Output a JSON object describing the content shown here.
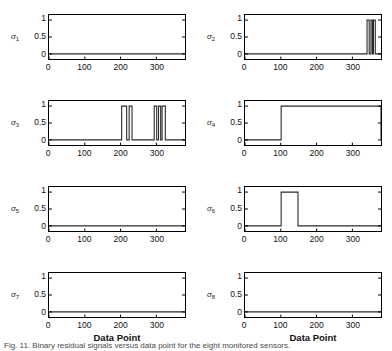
{
  "figure": {
    "xlabel": "Data Point",
    "caption_prefix": "Fig.",
    "caption": "Fig. 11.  Binary residual signals versus data point for the eight monitored sensors."
  },
  "chart_data": [
    {
      "type": "line",
      "title": "",
      "ylabel": "σ₁",
      "ylabel_base": "σ",
      "ylabel_sub": "1",
      "xlabel": "Data Point",
      "xlim": [
        0,
        380
      ],
      "ylim": [
        -0.15,
        1.15
      ],
      "xticks": [
        0,
        100,
        200,
        300
      ],
      "yticks": [
        0,
        0.5,
        1
      ],
      "grid": false,
      "x": [
        0,
        380
      ],
      "values": [
        0,
        0
      ],
      "steps": []
    },
    {
      "type": "line",
      "title": "",
      "ylabel": "σ₂",
      "ylabel_base": "σ",
      "ylabel_sub": "2",
      "xlabel": "Data Point",
      "xlim": [
        0,
        380
      ],
      "ylim": [
        -0.15,
        1.15
      ],
      "xticks": [
        0,
        100,
        200,
        300
      ],
      "yticks": [
        0,
        0.5,
        1
      ],
      "grid": false,
      "steps": [
        [
          341,
          347
        ],
        [
          352,
          356
        ],
        [
          359,
          364
        ]
      ]
    },
    {
      "type": "line",
      "title": "",
      "ylabel": "σ₃",
      "ylabel_base": "σ",
      "ylabel_sub": "3",
      "xlabel": "Data Point",
      "xlim": [
        0,
        380
      ],
      "ylim": [
        -0.15,
        1.15
      ],
      "xticks": [
        0,
        100,
        200,
        300
      ],
      "yticks": [
        0,
        0.5,
        1
      ],
      "grid": false,
      "steps": [
        [
          203,
          217
        ],
        [
          224,
          232
        ],
        [
          294,
          301
        ],
        [
          306,
          312
        ],
        [
          316,
          325
        ]
      ]
    },
    {
      "type": "line",
      "title": "",
      "ylabel": "σ₄",
      "ylabel_base": "σ",
      "ylabel_sub": "4",
      "xlabel": "Data Point",
      "xlim": [
        0,
        380
      ],
      "ylim": [
        -0.15,
        1.15
      ],
      "xticks": [
        0,
        100,
        200,
        300
      ],
      "yticks": [
        0,
        0.5,
        1
      ],
      "grid": false,
      "steps": [
        [
          101,
          380
        ]
      ]
    },
    {
      "type": "line",
      "title": "",
      "ylabel": "σ₅",
      "ylabel_base": "σ",
      "ylabel_sub": "5",
      "xlabel": "Data Point",
      "xlim": [
        0,
        380
      ],
      "ylim": [
        -0.15,
        1.15
      ],
      "xticks": [
        0,
        100,
        200,
        300
      ],
      "yticks": [
        0,
        0.5,
        1
      ],
      "grid": false,
      "steps": []
    },
    {
      "type": "line",
      "title": "",
      "ylabel": "σ₆",
      "ylabel_base": "σ",
      "ylabel_sub": "6",
      "xlabel": "Data Point",
      "xlim": [
        0,
        380
      ],
      "ylim": [
        -0.15,
        1.15
      ],
      "xticks": [
        0,
        100,
        200,
        300
      ],
      "yticks": [
        0,
        0.5,
        1
      ],
      "grid": false,
      "steps": [
        [
          101,
          148
        ]
      ]
    },
    {
      "type": "line",
      "title": "",
      "ylabel": "σ₇",
      "ylabel_base": "σ",
      "ylabel_sub": "7",
      "xlabel": "Data Point",
      "xlim": [
        0,
        380
      ],
      "ylim": [
        -0.15,
        1.15
      ],
      "xticks": [
        0,
        100,
        200,
        300
      ],
      "yticks": [
        0,
        0.5,
        1
      ],
      "grid": false,
      "steps": []
    },
    {
      "type": "line",
      "title": "",
      "ylabel": "σ₈",
      "ylabel_base": "σ",
      "ylabel_sub": "8",
      "xlabel": "Data Point",
      "xlim": [
        0,
        380
      ],
      "ylim": [
        -0.15,
        1.15
      ],
      "xticks": [
        0,
        100,
        200,
        300
      ],
      "yticks": [
        0,
        0.5,
        1
      ],
      "grid": false,
      "steps": []
    }
  ],
  "colors": {
    "line": "#2b2b2b",
    "axis": "#000000",
    "text": "#111111",
    "background": "#ffffff"
  }
}
